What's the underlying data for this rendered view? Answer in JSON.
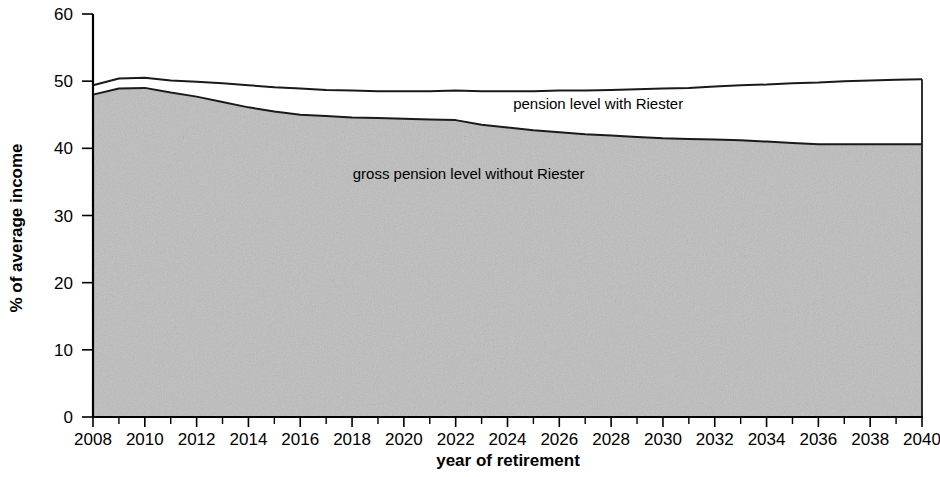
{
  "chart_data": {
    "type": "area",
    "title": "",
    "subtitle": "",
    "xlabel": "year of retirement",
    "ylabel": "% of average income",
    "xlim": [
      2008,
      2040
    ],
    "ylim": [
      0,
      60
    ],
    "grid": false,
    "legend_position": "inline-annotations",
    "y_ticks": [
      0,
      10,
      20,
      30,
      40,
      50,
      60
    ],
    "y_tick_labels": [
      "0",
      "10",
      "20",
      "30",
      "40",
      "50",
      "60"
    ],
    "x_ticks": [
      2008,
      2010,
      2012,
      2014,
      2016,
      2018,
      2020,
      2022,
      2024,
      2026,
      2028,
      2030,
      2032,
      2034,
      2036,
      2038,
      2040
    ],
    "x_tick_labels": [
      "2008",
      "2010",
      "2012",
      "2014",
      "2016",
      "2018",
      "2020",
      "2022",
      "2024",
      "2026",
      "2028",
      "2030",
      "2032",
      "2034",
      "2036",
      "2038",
      "2040"
    ],
    "x_minor_tick_step": 1,
    "x": [
      2008,
      2009,
      2010,
      2011,
      2012,
      2013,
      2014,
      2015,
      2016,
      2017,
      2018,
      2019,
      2020,
      2021,
      2022,
      2023,
      2024,
      2025,
      2026,
      2027,
      2028,
      2029,
      2030,
      2031,
      2032,
      2033,
      2034,
      2035,
      2036,
      2037,
      2038,
      2039,
      2040
    ],
    "series": [
      {
        "name": "pension level with Riester",
        "label": "pension level with Riester",
        "kind": "line",
        "fill": "none",
        "values": [
          49.4,
          50.4,
          50.5,
          50.1,
          49.9,
          49.7,
          49.4,
          49.1,
          48.9,
          48.7,
          48.6,
          48.5,
          48.5,
          48.5,
          48.6,
          48.5,
          48.5,
          48.5,
          48.6,
          48.6,
          48.7,
          48.8,
          48.9,
          49.0,
          49.2,
          49.4,
          49.5,
          49.7,
          49.8,
          50.0,
          50.1,
          50.2,
          50.3
        ]
      },
      {
        "name": "gross pension level without Riester",
        "label": "gross pension level without Riester",
        "kind": "area",
        "fill": "#bdbdbd",
        "values": [
          48.0,
          48.9,
          49.0,
          48.3,
          47.7,
          46.9,
          46.1,
          45.5,
          45.0,
          44.8,
          44.6,
          44.5,
          44.4,
          44.3,
          44.2,
          43.5,
          43.1,
          42.7,
          42.4,
          42.1,
          41.9,
          41.7,
          41.5,
          41.4,
          41.3,
          41.2,
          41.0,
          40.8,
          40.6,
          40.6,
          40.6,
          40.6,
          40.6
        ]
      }
    ],
    "annotations": [
      {
        "text": "pension level with Riester",
        "x_year": 2027.5,
        "y_value": 45.8
      },
      {
        "text": "gross pension level without Riester",
        "x_year": 2022.5,
        "y_value": 35.5
      }
    ],
    "colors": {
      "area_fill": "#bdbdbd",
      "line": "#1a1a1a",
      "axis": "#000000",
      "background": "#ffffff"
    }
  }
}
